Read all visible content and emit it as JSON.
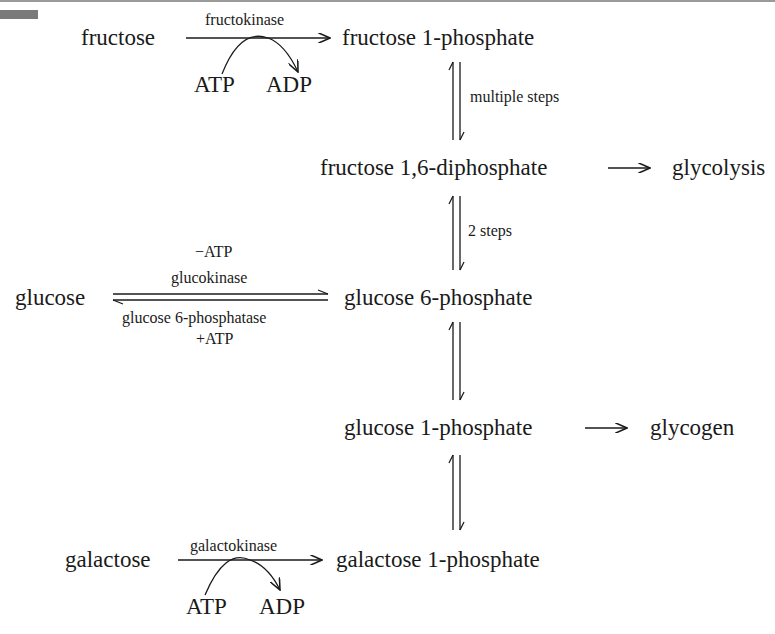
{
  "diagram": {
    "nodes": {
      "fructose": "fructose",
      "fructose_1p": "fructose 1-phosphate",
      "fructose_16dp": "fructose 1,6-diphosphate",
      "glycolysis": "glycolysis",
      "glucose": "glucose",
      "glucose_6p": "glucose 6-phosphate",
      "glucose_1p": "glucose 1-phosphate",
      "glycogen": "glycogen",
      "galactose": "galactose",
      "galactose_1p": "galactose 1-phosphate"
    },
    "edges": {
      "fructokinase": {
        "enzyme": "fructokinase",
        "in": "ATP",
        "out": "ADP"
      },
      "multiple_steps": "multiple steps",
      "two_steps": "2 steps",
      "glucokinase": {
        "enzyme": "glucokinase",
        "cofactor": "−ATP"
      },
      "g6pase": {
        "enzyme": "glucose 6-phosphatase",
        "cofactor": "+ATP"
      },
      "galactokinase": {
        "enzyme": "galactokinase",
        "in": "ATP",
        "out": "ADP"
      }
    }
  }
}
